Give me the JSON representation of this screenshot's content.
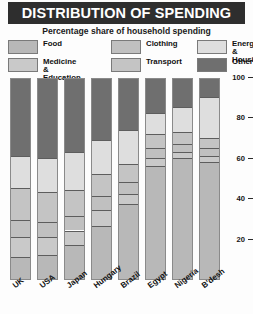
{
  "header": {
    "title": "DISTRIBUTION OF SPENDING",
    "subtitle": "Percentage share of household spending"
  },
  "legend": {
    "items": [
      {
        "label": "Food",
        "color": "#b8b8b8"
      },
      {
        "label": "Medicine &\nEducation",
        "color": "#c9c9c9"
      },
      {
        "label": "Clothing",
        "color": "#c0c0c0"
      },
      {
        "label": "Transport",
        "color": "#c4c4c4"
      },
      {
        "label": "Energy &\nHousing",
        "color": "#dedede"
      },
      {
        "label": "Other",
        "color": "#6f6f6f"
      }
    ]
  },
  "chart_data": {
    "type": "bar",
    "stacked": true,
    "title": "DISTRIBUTION OF SPENDING",
    "subtitle": "Percentage share of household spending",
    "xlabel": "",
    "ylabel": "",
    "ylim": [
      0,
      100
    ],
    "yticks": [
      20,
      40,
      60,
      80,
      100
    ],
    "grid": false,
    "legend_position": "top",
    "categories": [
      "UK",
      "USA",
      "Japan",
      "Hungary",
      "Brazil",
      "Egypt",
      "Nigeria",
      "B'desh"
    ],
    "series": [
      {
        "name": "Food",
        "color": "#b8b8b8",
        "values": [
          12,
          13,
          18,
          27,
          38,
          57,
          61,
          59
        ]
      },
      {
        "name": "Medicine & Education",
        "color": "#c9c9c9",
        "values": [
          10,
          9,
          7,
          8,
          5,
          4,
          3,
          3
        ]
      },
      {
        "name": "Clothing",
        "color": "#c0c0c0",
        "values": [
          8,
          7,
          7,
          7,
          6,
          5,
          4,
          4
        ]
      },
      {
        "name": "Transport",
        "color": "#c4c4c4",
        "values": [
          16,
          15,
          13,
          11,
          9,
          7,
          6,
          5
        ]
      },
      {
        "name": "Energy & Housing",
        "color": "#dedede",
        "values": [
          16,
          17,
          19,
          17,
          17,
          10,
          12,
          20
        ]
      },
      {
        "name": "Other",
        "color": "#6f6f6f",
        "values": [
          38,
          39,
          36,
          30,
          25,
          17,
          14,
          9
        ]
      }
    ]
  },
  "bars": [
    {
      "label": "UK",
      "segments": [
        {
          "name": "Other",
          "color": "#6f6f6f",
          "from": 62,
          "to": 100
        },
        {
          "name": "Energy & Housing",
          "color": "#dedede",
          "from": 46,
          "to": 62
        },
        {
          "name": "Transport",
          "color": "#c4c4c4",
          "from": 30,
          "to": 46
        },
        {
          "name": "Clothing",
          "color": "#c0c0c0",
          "from": 22,
          "to": 30
        },
        {
          "name": "Medicine & Education",
          "color": "#c9c9c9",
          "from": 12,
          "to": 22
        },
        {
          "name": "Food",
          "color": "#b8b8b8",
          "from": 0,
          "to": 12
        }
      ]
    },
    {
      "label": "USA",
      "segments": [
        {
          "name": "Other",
          "color": "#6f6f6f",
          "from": 61,
          "to": 100
        },
        {
          "name": "Energy & Housing",
          "color": "#dedede",
          "from": 44,
          "to": 61
        },
        {
          "name": "Transport",
          "color": "#c4c4c4",
          "from": 29,
          "to": 44
        },
        {
          "name": "Clothing",
          "color": "#c0c0c0",
          "from": 22,
          "to": 29
        },
        {
          "name": "Medicine & Education",
          "color": "#c9c9c9",
          "from": 13,
          "to": 22
        },
        {
          "name": "Food",
          "color": "#b8b8b8",
          "from": 0,
          "to": 13
        }
      ]
    },
    {
      "label": "Japan",
      "segments": [
        {
          "name": "Other",
          "color": "#6f6f6f",
          "from": 64,
          "to": 100
        },
        {
          "name": "Energy & Housing",
          "color": "#dedede",
          "from": 45,
          "to": 64
        },
        {
          "name": "Transport",
          "color": "#c4c4c4",
          "from": 32,
          "to": 45
        },
        {
          "name": "Clothing",
          "color": "#c0c0c0",
          "from": 25,
          "to": 32
        },
        {
          "name": "Medicine & Education",
          "color": "#c9c9c9",
          "from": 18,
          "to": 25
        },
        {
          "name": "Food",
          "color": "#b8b8b8",
          "from": 0,
          "to": 18
        }
      ]
    },
    {
      "label": "Hungary",
      "segments": [
        {
          "name": "Other",
          "color": "#6f6f6f",
          "from": 70,
          "to": 100
        },
        {
          "name": "Energy & Housing",
          "color": "#dedede",
          "from": 53,
          "to": 70
        },
        {
          "name": "Transport",
          "color": "#c4c4c4",
          "from": 42,
          "to": 53
        },
        {
          "name": "Clothing",
          "color": "#c0c0c0",
          "from": 35,
          "to": 42
        },
        {
          "name": "Medicine & Education",
          "color": "#c9c9c9",
          "from": 27,
          "to": 35
        },
        {
          "name": "Food",
          "color": "#b8b8b8",
          "from": 0,
          "to": 27
        }
      ]
    },
    {
      "label": "Brazil",
      "segments": [
        {
          "name": "Other",
          "color": "#6f6f6f",
          "from": 75,
          "to": 100
        },
        {
          "name": "Energy & Housing",
          "color": "#dedede",
          "from": 58,
          "to": 75
        },
        {
          "name": "Transport",
          "color": "#c4c4c4",
          "from": 49,
          "to": 58
        },
        {
          "name": "Clothing",
          "color": "#c0c0c0",
          "from": 43,
          "to": 49
        },
        {
          "name": "Medicine & Education",
          "color": "#c9c9c9",
          "from": 38,
          "to": 43
        },
        {
          "name": "Food",
          "color": "#b8b8b8",
          "from": 0,
          "to": 38
        }
      ]
    },
    {
      "label": "Egypt",
      "segments": [
        {
          "name": "Other",
          "color": "#6f6f6f",
          "from": 83,
          "to": 100
        },
        {
          "name": "Energy & Housing",
          "color": "#dedede",
          "from": 73,
          "to": 83
        },
        {
          "name": "Transport",
          "color": "#c4c4c4",
          "from": 66,
          "to": 73
        },
        {
          "name": "Clothing",
          "color": "#c0c0c0",
          "from": 61,
          "to": 66
        },
        {
          "name": "Medicine & Education",
          "color": "#c9c9c9",
          "from": 57,
          "to": 61
        },
        {
          "name": "Food",
          "color": "#b8b8b8",
          "from": 0,
          "to": 57
        }
      ]
    },
    {
      "label": "Nigeria",
      "segments": [
        {
          "name": "Other",
          "color": "#6f6f6f",
          "from": 86,
          "to": 100
        },
        {
          "name": "Energy & Housing",
          "color": "#dedede",
          "from": 74,
          "to": 86
        },
        {
          "name": "Transport",
          "color": "#c4c4c4",
          "from": 68,
          "to": 74
        },
        {
          "name": "Clothing",
          "color": "#c0c0c0",
          "from": 64,
          "to": 68
        },
        {
          "name": "Medicine & Education",
          "color": "#c9c9c9",
          "from": 61,
          "to": 64
        },
        {
          "name": "Food",
          "color": "#b8b8b8",
          "from": 0,
          "to": 61
        }
      ]
    },
    {
      "label": "B'desh",
      "segments": [
        {
          "name": "Other",
          "color": "#6f6f6f",
          "from": 91,
          "to": 100
        },
        {
          "name": "Energy & Housing",
          "color": "#dedede",
          "from": 71,
          "to": 91
        },
        {
          "name": "Transport",
          "color": "#c4c4c4",
          "from": 66,
          "to": 71
        },
        {
          "name": "Clothing",
          "color": "#c0c0c0",
          "from": 62,
          "to": 66
        },
        {
          "name": "Medicine & Education",
          "color": "#c9c9c9",
          "from": 59,
          "to": 62
        },
        {
          "name": "Food",
          "color": "#b8b8b8",
          "from": 0,
          "to": 59
        }
      ]
    }
  ],
  "axis": {
    "ticks": [
      {
        "value": "100"
      },
      {
        "value": "80"
      },
      {
        "value": "60"
      },
      {
        "value": "40"
      },
      {
        "value": "20"
      }
    ]
  }
}
